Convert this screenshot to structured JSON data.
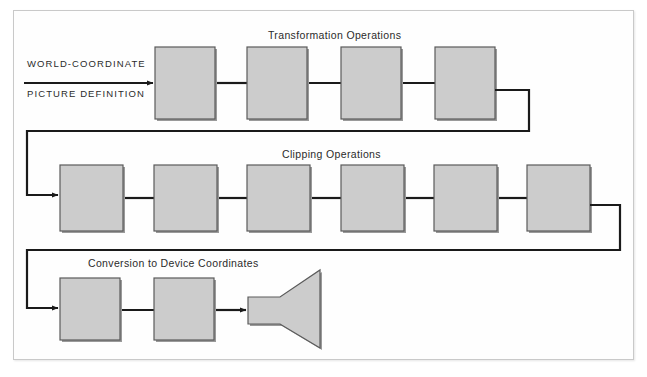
{
  "figure": {
    "title_visible": false,
    "background": "#ffffff",
    "frame_color": "#c9c9c9"
  },
  "colors": {
    "box_fill": "#cccccc",
    "box_border": "#5a5a5a",
    "box_shadow": "#9a9a9a",
    "wire": "#1a1a1a",
    "text": "#2b2b2b",
    "frame": "#c9c9c9"
  },
  "input": {
    "line1": "WORLD-COORDINATE",
    "line2": "PICTURE DEFINITION"
  },
  "stages": [
    {
      "id": "transformation",
      "label": "Transformation Operations",
      "box_count": 4
    },
    {
      "id": "clipping",
      "label": "Clipping Operations",
      "box_count": 6
    },
    {
      "id": "conversion",
      "label": "Conversion to  Device Coordinates",
      "box_count": 2
    }
  ],
  "output_device": {
    "name": "crt-display",
    "label": ""
  },
  "row1_boxes": [
    {
      "x": 155,
      "y": 47,
      "w": 60,
      "h": 72
    },
    {
      "x": 247,
      "y": 47,
      "w": 60,
      "h": 72
    },
    {
      "x": 341,
      "y": 47,
      "w": 60,
      "h": 72
    },
    {
      "x": 435,
      "y": 47,
      "w": 60,
      "h": 72
    }
  ],
  "row2_boxes": [
    {
      "x": 60,
      "y": 165,
      "w": 63,
      "h": 66
    },
    {
      "x": 154,
      "y": 165,
      "w": 63,
      "h": 66
    },
    {
      "x": 247,
      "y": 165,
      "w": 63,
      "h": 66
    },
    {
      "x": 341,
      "y": 165,
      "w": 63,
      "h": 66
    },
    {
      "x": 434,
      "y": 165,
      "w": 63,
      "h": 66
    },
    {
      "x": 527,
      "y": 165,
      "w": 63,
      "h": 66
    }
  ],
  "row3_boxes": [
    {
      "x": 60,
      "y": 278,
      "w": 60,
      "h": 62
    },
    {
      "x": 154,
      "y": 278,
      "w": 60,
      "h": 62
    }
  ],
  "labels_position": {
    "transformation": {
      "x": 268,
      "y": 29
    },
    "clipping": {
      "x": 282,
      "y": 148
    },
    "conversion": {
      "x": 88,
      "y": 257
    },
    "input": {
      "x": 27,
      "y": 58
    }
  }
}
